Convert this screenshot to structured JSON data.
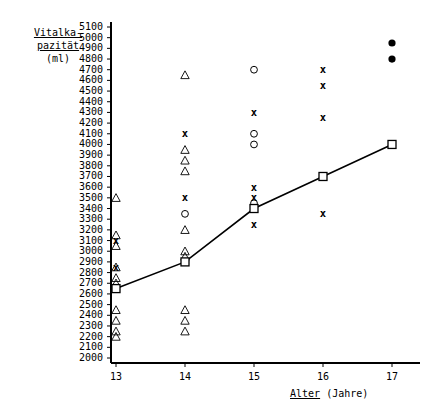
{
  "chart_data": {
    "type": "scatter",
    "title": "",
    "ylabel_lines": [
      "Vitalka-",
      "pazität",
      "(ml)"
    ],
    "xlabel_underlined": "Alter",
    "xlabel_rest": " (Jahre)",
    "xlabel": "Alter (Jahre)",
    "ylabel": "Vitalkapazität (ml)",
    "xlim": [
      12.6,
      17.4
    ],
    "ylim": [
      2000,
      5100
    ],
    "xticks": [
      13,
      14,
      15,
      16,
      17
    ],
    "yticks": [
      2000,
      2100,
      2200,
      2300,
      2400,
      2500,
      2600,
      2700,
      2800,
      2900,
      3000,
      3100,
      3200,
      3300,
      3400,
      3500,
      3600,
      3700,
      3800,
      3900,
      4000,
      4100,
      4200,
      4300,
      4400,
      4500,
      4600,
      4700,
      4800,
      4900,
      5000,
      5100
    ],
    "grid": false,
    "legend": "none",
    "series": [
      {
        "name": "triangle",
        "marker": "triangle-open",
        "points": [
          [
            13,
            3500
          ],
          [
            13,
            3150
          ],
          [
            13,
            3050
          ],
          [
            13,
            2850
          ],
          [
            13,
            2750
          ],
          [
            13,
            2700
          ],
          [
            13,
            2450
          ],
          [
            13,
            2350
          ],
          [
            13,
            2250
          ],
          [
            13,
            2200
          ],
          [
            14,
            4650
          ],
          [
            14,
            3950
          ],
          [
            14,
            3850
          ],
          [
            14,
            3750
          ],
          [
            14,
            3200
          ],
          [
            14,
            3000
          ],
          [
            14,
            2950
          ],
          [
            14,
            2450
          ],
          [
            14,
            2350
          ],
          [
            14,
            2250
          ]
        ]
      },
      {
        "name": "cross",
        "marker": "x",
        "points": [
          [
            13,
            3100
          ],
          [
            13,
            2850
          ],
          [
            14,
            4100
          ],
          [
            14,
            3500
          ],
          [
            15,
            4300
          ],
          [
            15,
            3600
          ],
          [
            15,
            3500
          ],
          [
            15,
            3250
          ],
          [
            16,
            4700
          ],
          [
            16,
            4550
          ],
          [
            16,
            4250
          ],
          [
            16,
            3350
          ]
        ]
      },
      {
        "name": "circle",
        "marker": "circle-open",
        "points": [
          [
            14,
            3350
          ],
          [
            15,
            4700
          ],
          [
            15,
            4100
          ],
          [
            15,
            4000
          ],
          [
            15,
            3450
          ]
        ]
      },
      {
        "name": "filled-dot",
        "marker": "circle-filled",
        "points": [
          [
            17,
            4950
          ],
          [
            17,
            4800
          ]
        ]
      },
      {
        "name": "mean-line",
        "marker": "square-open",
        "connected": true,
        "points": [
          [
            13,
            2650
          ],
          [
            14,
            2900
          ],
          [
            15,
            3400
          ],
          [
            16,
            3700
          ],
          [
            17,
            4000
          ]
        ]
      }
    ]
  }
}
